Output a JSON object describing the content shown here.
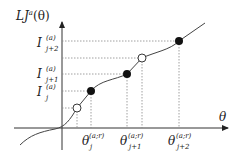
{
  "diagram": {
    "y_axis_label": "LJ",
    "y_axis_label_sup": "a",
    "y_axis_label_arg": "(θ)",
    "x_axis_label": "θ",
    "y_ticks": [
      {
        "main": "I",
        "sup": "(a)",
        "sub": "j+2"
      },
      {
        "main": "I",
        "sup": "(a)",
        "sub": "j+1"
      },
      {
        "main": "I",
        "sup": "(a)",
        "sub": "j"
      }
    ],
    "x_ticks": [
      {
        "main": "θ",
        "sup": "(a;r)",
        "sub": "j"
      },
      {
        "main": "θ",
        "sup": "(a;r)",
        "sub": "j+1"
      },
      {
        "main": "θ",
        "sup": "(a;r)",
        "sub": "j+2"
      }
    ],
    "points": [
      {
        "type": "open",
        "x": 77,
        "y": 108
      },
      {
        "type": "filled",
        "x": 91,
        "y": 91
      },
      {
        "type": "filled",
        "x": 127,
        "y": 74
      },
      {
        "type": "open",
        "x": 142,
        "y": 58
      },
      {
        "type": "filled",
        "x": 179,
        "y": 41
      }
    ]
  }
}
